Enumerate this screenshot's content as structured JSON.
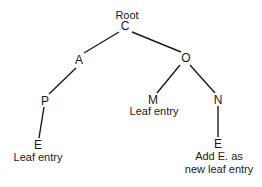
{
  "diagram": {
    "type": "tree",
    "root_label": "Root",
    "nodes": {
      "C": "C",
      "A": "A",
      "O": "O",
      "P": "P",
      "M": "M",
      "N": "N",
      "E_left": "E",
      "E_right": "E"
    },
    "annotations": {
      "m_leaf": "Leaf entry",
      "e_left_leaf": "Leaf entry",
      "e_right_line1": "Add E. as",
      "e_right_line2": "new leaf entry"
    },
    "edges": [
      [
        "C",
        "A"
      ],
      [
        "C",
        "O"
      ],
      [
        "A",
        "P"
      ],
      [
        "O",
        "M"
      ],
      [
        "O",
        "N"
      ],
      [
        "P",
        "E_left"
      ],
      [
        "N",
        "E_right"
      ]
    ],
    "line_color": "#1a1a1a"
  }
}
